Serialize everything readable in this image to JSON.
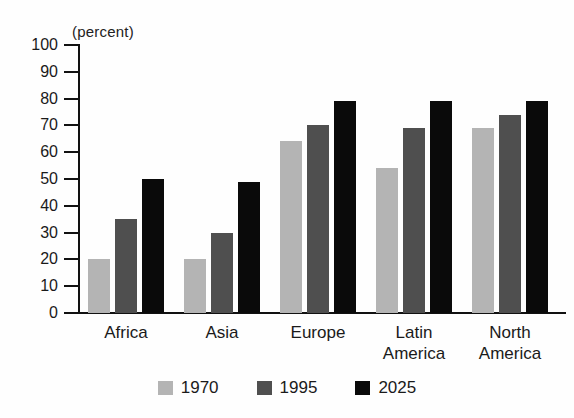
{
  "chart_data": {
    "type": "bar",
    "title": "",
    "subtitle": "",
    "unit_label": "(percent)",
    "xlabel": "",
    "ylabel": "",
    "ylim": [
      0,
      100
    ],
    "ytick_step": 10,
    "ytick_labels": [
      "100",
      "90",
      "80",
      "70",
      "60",
      "50",
      "40",
      "30",
      "20",
      "10",
      "0"
    ],
    "ytick_values": [
      100,
      90,
      80,
      70,
      60,
      50,
      40,
      30,
      20,
      10,
      0
    ],
    "grid": false,
    "legend_position": "bottom-center",
    "categories": [
      "Africa",
      "Asia",
      "Europe",
      "Latin\nAmerica",
      "North\nAmerica"
    ],
    "series": [
      {
        "name": "1970",
        "color": "#b4b4b4",
        "values": [
          20,
          20,
          64,
          54,
          69
        ]
      },
      {
        "name": "1995",
        "color": "#4f4f4f",
        "values": [
          35,
          30,
          70,
          69,
          74
        ]
      },
      {
        "name": "2025",
        "color": "#0a0a0a",
        "values": [
          50,
          49,
          79,
          79,
          79
        ]
      }
    ]
  },
  "colors": {
    "background": "#fefefe",
    "axis": "#111111",
    "text": "#1a1a1a",
    "series_1970": "#b4b4b4",
    "series_1995": "#4f4f4f",
    "series_2025": "#0a0a0a"
  }
}
